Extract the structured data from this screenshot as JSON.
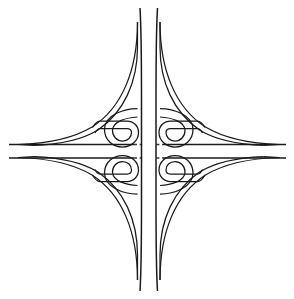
{
  "document": {
    "title": "Cloverleaf Interchange Diagram",
    "type": "line-drawing",
    "background_color": "#ffffff",
    "line_color": "#1a1a1a",
    "under_line_color": "#3a3a3a"
  },
  "canvas": {
    "width": 294,
    "height": 299
  },
  "diagram": {
    "name": "full-cloverleaf-interchange",
    "symmetry": "4-fold",
    "center": {
      "x": 148,
      "y": 151
    }
  },
  "mainline_vertical": {
    "name": "vertical-highway",
    "orientation": "north-south",
    "carriageways": [
      {
        "name": "west-carriageway",
        "x": 141.5,
        "y_start": 8,
        "y_end": 291
      },
      {
        "name": "east-carriageway",
        "x": 156.0,
        "y_start": 8,
        "y_end": 291
      }
    ],
    "flare_top": 1.0,
    "flare_bottom": 1.0,
    "level": "over"
  },
  "mainline_horizontal": {
    "name": "horizontal-highway",
    "orientation": "east-west",
    "carriageways": [
      {
        "name": "north-carriageway",
        "y": 144.5,
        "x_start": 9,
        "x_end": 286
      },
      {
        "name": "south-carriageway",
        "y": 158.0,
        "x_start": 9,
        "x_end": 286
      }
    ],
    "level": "under"
  },
  "loop_ramps": [
    {
      "name": "loop-ramp-northwest",
      "quadrant": "NW",
      "cx": 122.5,
      "cy": 126.0,
      "r": 17.5
    },
    {
      "name": "loop-ramp-northeast",
      "quadrant": "NE",
      "cx": 174.0,
      "cy": 126.0,
      "r": 17.5
    },
    {
      "name": "loop-ramp-southwest",
      "quadrant": "SW",
      "cx": 122.5,
      "cy": 176.5,
      "r": 17.5
    },
    {
      "name": "loop-ramp-southeast",
      "quadrant": "SE",
      "cx": 174.0,
      "cy": 176.5,
      "r": 17.5
    }
  ],
  "connector_ramps": [
    {
      "name": "connector-ramp-northwest",
      "quadrant": "NW"
    },
    {
      "name": "connector-ramp-northeast",
      "quadrant": "NE"
    },
    {
      "name": "connector-ramp-southwest",
      "quadrant": "SW"
    },
    {
      "name": "connector-ramp-southeast",
      "quadrant": "SE"
    }
  ],
  "labels": {
    "none_visible": ""
  }
}
